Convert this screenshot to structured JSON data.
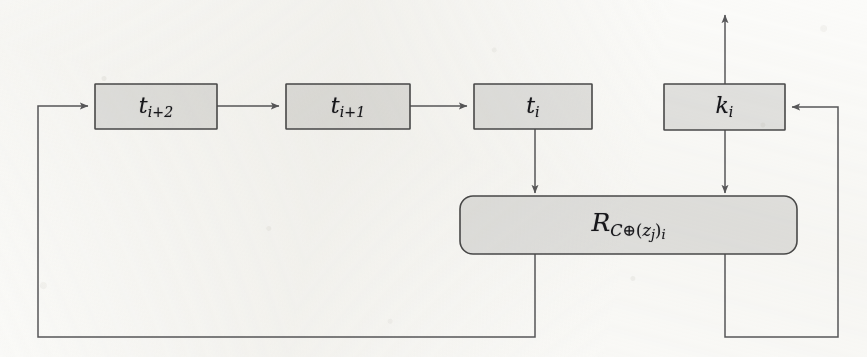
{
  "diagram": {
    "type": "block-diagram",
    "background_color": "#fbfbf9",
    "box_fill_color": "#e2e2e0",
    "box_stroke_color": "#4a4a4a",
    "line_color": "#58585a",
    "text_color": "#16161a",
    "nodes": [
      {
        "id": "t-i-plus-2",
        "shape": "rect",
        "label_base": "t",
        "label_sub": "i+2",
        "x": 95,
        "y": 84,
        "w": 122,
        "h": 45
      },
      {
        "id": "t-i-plus-1",
        "shape": "rect",
        "label_base": "t",
        "label_sub": "i+1",
        "x": 286,
        "y": 84,
        "w": 124,
        "h": 45
      },
      {
        "id": "t-i",
        "shape": "rect",
        "label_base": "t",
        "label_sub": "i",
        "x": 474,
        "y": 84,
        "w": 118,
        "h": 45
      },
      {
        "id": "k-i",
        "shape": "rect",
        "label_base": "k",
        "label_sub": "i",
        "x": 664,
        "y": 84,
        "w": 121,
        "h": 46
      },
      {
        "id": "r-function",
        "shape": "rounded-rect",
        "label_base": "R",
        "label_sub": "C⊕(z_j)_i",
        "label_sub_plain": "C⊕(z",
        "label_sub_j": "j",
        "label_sub_tail": ")",
        "label_sub_i": "i",
        "x": 460,
        "y": 196,
        "w": 337,
        "h": 58
      }
    ],
    "edges": [
      {
        "id": "edge-feedback-left-into-t-i-plus-2",
        "from": "feedback-bus-left",
        "to": "t-i-plus-2",
        "arrow": true,
        "direction": "right"
      },
      {
        "id": "edge-t-i-plus-2-to-t-i-plus-1",
        "from": "t-i-plus-2",
        "to": "t-i-plus-1",
        "arrow": true,
        "direction": "right"
      },
      {
        "id": "edge-t-i-plus-1-to-t-i",
        "from": "t-i-plus-1",
        "to": "t-i",
        "arrow": true,
        "direction": "right"
      },
      {
        "id": "edge-t-i-to-r-function",
        "from": "t-i",
        "to": "r-function",
        "arrow": true,
        "direction": "down"
      },
      {
        "id": "edge-k-i-to-r-function",
        "from": "k-i",
        "to": "r-function",
        "arrow": true,
        "direction": "down"
      },
      {
        "id": "edge-k-i-output-up",
        "from": "k-i",
        "to": "output",
        "arrow": true,
        "direction": "up"
      },
      {
        "id": "edge-r-function-feedback-left",
        "from": "r-function",
        "to": "t-i-plus-2",
        "arrow": true,
        "direction": "loop-left"
      },
      {
        "id": "edge-r-function-feedback-right",
        "from": "r-function",
        "to": "k-i",
        "arrow": true,
        "direction": "loop-right"
      }
    ]
  }
}
